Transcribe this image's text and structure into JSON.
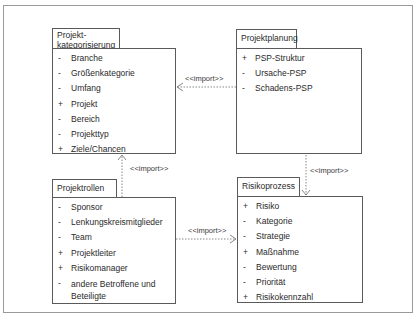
{
  "packages": [
    {
      "id": "projektkategorisierung",
      "title_lines": [
        "Projekt-",
        "kategorisierung"
      ],
      "items": [
        {
          "vis": "-",
          "name": "Branche"
        },
        {
          "vis": "-",
          "name": "Größenkategorie"
        },
        {
          "vis": "-",
          "name": "Umfang"
        },
        {
          "vis": "+",
          "name": "Projekt"
        },
        {
          "vis": "-",
          "name": "Bereich"
        },
        {
          "vis": "-",
          "name": "Projekttyp"
        },
        {
          "vis": "+",
          "name": "Ziele/Chancen"
        }
      ]
    },
    {
      "id": "projektplanung",
      "title_lines": [
        "Projektplanung"
      ],
      "items": [
        {
          "vis": "+",
          "name": "PSP-Struktur"
        },
        {
          "vis": "-",
          "name": "Ursache-PSP"
        },
        {
          "vis": "-",
          "name": "Schadens-PSP"
        }
      ]
    },
    {
      "id": "projektrollen",
      "title_lines": [
        "Projektrollen"
      ],
      "items": [
        {
          "vis": "-",
          "name": "Sponsor"
        },
        {
          "vis": "-",
          "name": "Lenkungskreismitglieder"
        },
        {
          "vis": "-",
          "name": "Team"
        },
        {
          "vis": "+",
          "name": "Projektleiter"
        },
        {
          "vis": "+",
          "name": "Risikomanager"
        },
        {
          "vis": "-",
          "name": "andere Betroffene und Beteiligte"
        }
      ]
    },
    {
      "id": "risikoprozess",
      "title_lines": [
        "Risikoprozess"
      ],
      "items": [
        {
          "vis": "+",
          "name": "Risiko"
        },
        {
          "vis": "-",
          "name": "Kategorie"
        },
        {
          "vis": "-",
          "name": "Strategie"
        },
        {
          "vis": "+",
          "name": "Maßnahme"
        },
        {
          "vis": "-",
          "name": "Bewertung"
        },
        {
          "vis": "-",
          "name": "Priorität"
        },
        {
          "vis": "+",
          "name": "Risikokennzahl"
        }
      ]
    }
  ],
  "dependencies": [
    {
      "from": "Projektplanung",
      "to": "Projektkategorisierung",
      "label": "<<import>>"
    },
    {
      "from": "Projektrollen",
      "to": "Projektkategorisierung",
      "label": "<<import>>"
    },
    {
      "from": "Projektplanung",
      "to": "Risikoprozess",
      "label": "<<import>>"
    },
    {
      "from": "Projektrollen",
      "to": "Risikoprozess",
      "label": "<<import>>"
    }
  ],
  "colors": {
    "line": "#5a5a5a",
    "frame": "#9a9a9a",
    "text": "#2a2a2a"
  }
}
